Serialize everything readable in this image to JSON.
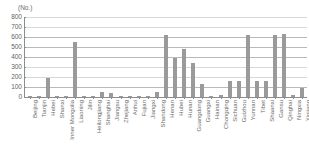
{
  "chart_data": {
    "type": "bar",
    "title": "",
    "subtitle": "",
    "xlabel": "",
    "ylabel": "(No.)",
    "unit_label": "(No.)",
    "ylim": [
      0,
      800
    ],
    "ytick_step": 100,
    "yticks": [
      "800",
      "700",
      "600",
      "500",
      "400",
      "300",
      "200",
      "100",
      "0"
    ],
    "grid": true,
    "grid_orientation": "horizontal",
    "legend": null,
    "bar_color": "#9a9a9a",
    "categories": [
      "Beijing",
      "Tianjin",
      "Hebei",
      "Shanxi",
      "Inner Mongolia",
      "Liaoning",
      "Jilin",
      "Heilongjiang",
      "Shanghai",
      "Jiangsu",
      "Zhejiang",
      "Anhui",
      "Fujian",
      "Jiangxi",
      "Shandong",
      "Henan",
      "Hubei",
      "Hunan",
      "Guangdong",
      "Guangxi",
      "Hainan",
      "Chongqing",
      "Sichuan",
      "Guizhou",
      "Yunnan",
      "Tibet",
      "Shaanxi",
      "Gansu",
      "Qinghai",
      "Ningxia",
      "Xinjiang"
    ],
    "values": [
      15,
      10,
      195,
      15,
      10,
      550,
      10,
      10,
      55,
      45,
      10,
      10,
      10,
      10,
      50,
      625,
      390,
      480,
      340,
      135,
      10,
      25,
      160,
      165,
      625,
      160,
      160,
      625,
      630,
      25,
      95
    ]
  }
}
